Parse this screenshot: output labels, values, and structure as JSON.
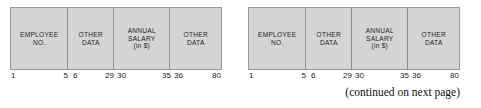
{
  "figure": {
    "type": "record-layout-diagram",
    "fill_color": "#d4d4d4",
    "border_color": "#9a9a9a",
    "divider_color": "#8d8d8d",
    "background_color": "#ffffff",
    "caption": "(continued on next page)"
  },
  "records": [
    {
      "id": "record-left",
      "fields": [
        {
          "lines": [
            "EMPLOYEE",
            "NO."
          ],
          "start": "1",
          "end": "5"
        },
        {
          "lines": [
            "OTHER",
            "DATA"
          ],
          "start": "6",
          "end": "29"
        },
        {
          "lines": [
            "ANNUAL",
            "SALARY",
            "(in $)"
          ],
          "start": "30",
          "end": "35"
        },
        {
          "lines": [
            "OTHER",
            "DATA"
          ],
          "start": "36",
          "end": "80"
        }
      ],
      "ruler": [
        {
          "value": "1",
          "align": "left"
        },
        {
          "value": "5",
          "align": "right"
        },
        {
          "value": "6",
          "align": "left"
        },
        {
          "value": "29",
          "align": "right"
        },
        {
          "value": "30",
          "align": "left"
        },
        {
          "value": "35",
          "align": "right"
        },
        {
          "value": "36",
          "align": "left"
        },
        {
          "value": "80",
          "align": "right"
        }
      ]
    },
    {
      "id": "record-right",
      "fields": [
        {
          "lines": [
            "EMPLOYEE",
            "NO."
          ],
          "start": "1",
          "end": "5"
        },
        {
          "lines": [
            "OTHER",
            "DATA"
          ],
          "start": "6",
          "end": "29"
        },
        {
          "lines": [
            "ANNUAL",
            "SALARY",
            "(in $)"
          ],
          "start": "30",
          "end": "35"
        },
        {
          "lines": [
            "OTHER",
            "DATA"
          ],
          "start": "36",
          "end": "80"
        }
      ],
      "ruler": [
        {
          "value": "1",
          "align": "left"
        },
        {
          "value": "5",
          "align": "right"
        },
        {
          "value": "6",
          "align": "left"
        },
        {
          "value": "29",
          "align": "right"
        },
        {
          "value": "30",
          "align": "left"
        },
        {
          "value": "35",
          "align": "right"
        },
        {
          "value": "36",
          "align": "left"
        },
        {
          "value": "80",
          "align": "right"
        }
      ]
    }
  ]
}
